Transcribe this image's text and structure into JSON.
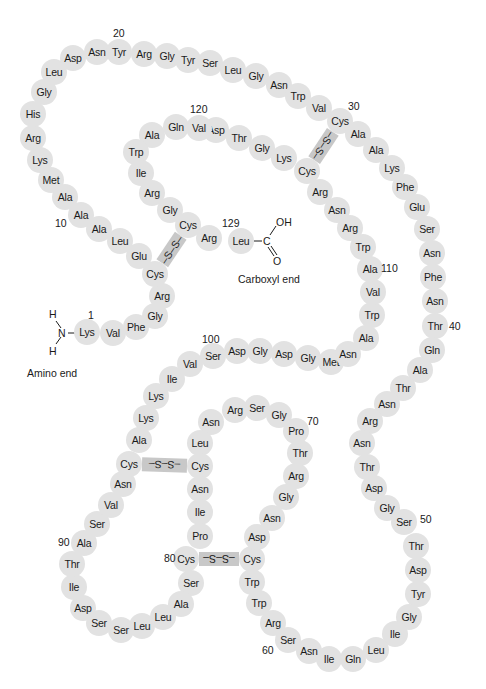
{
  "diagram": {
    "circle_color": "#e2e2e2",
    "bridge_color": "#c8c8c8",
    "residues": [
      {
        "n": 1,
        "aa": "Lys",
        "x": 87,
        "y": 332
      },
      {
        "n": 2,
        "aa": "Val",
        "x": 113,
        "y": 333
      },
      {
        "n": 3,
        "aa": "Phe",
        "x": 136,
        "y": 327
      },
      {
        "n": 4,
        "aa": "Gly",
        "x": 155,
        "y": 316
      },
      {
        "n": 5,
        "aa": "Arg",
        "x": 162,
        "y": 296
      },
      {
        "n": 6,
        "aa": "Cys",
        "x": 155,
        "y": 274
      },
      {
        "n": 7,
        "aa": "Glu",
        "x": 139,
        "y": 256
      },
      {
        "n": 8,
        "aa": "Leu",
        "x": 120,
        "y": 241
      },
      {
        "n": 9,
        "aa": "Ala",
        "x": 99,
        "y": 229
      },
      {
        "n": 10,
        "aa": "Ala",
        "x": 81,
        "y": 215
      },
      {
        "n": 11,
        "aa": "Ala",
        "x": 65,
        "y": 197
      },
      {
        "n": 12,
        "aa": "Met",
        "x": 51,
        "y": 180
      },
      {
        "n": 13,
        "aa": "Lys",
        "x": 40,
        "y": 160
      },
      {
        "n": 14,
        "aa": "Arg",
        "x": 33,
        "y": 138
      },
      {
        "n": 15,
        "aa": "His",
        "x": 33,
        "y": 114
      },
      {
        "n": 16,
        "aa": "Gly",
        "x": 44,
        "y": 92
      },
      {
        "n": 17,
        "aa": "Leu",
        "x": 54,
        "y": 72
      },
      {
        "n": 18,
        "aa": "Asp",
        "x": 73,
        "y": 58
      },
      {
        "n": 19,
        "aa": "Asn",
        "x": 97,
        "y": 52
      },
      {
        "n": 20,
        "aa": "Tyr",
        "x": 119,
        "y": 52
      },
      {
        "n": 21,
        "aa": "Arg",
        "x": 144,
        "y": 54
      },
      {
        "n": 22,
        "aa": "Gly",
        "x": 167,
        "y": 56
      },
      {
        "n": 23,
        "aa": "Tyr",
        "x": 188,
        "y": 60
      },
      {
        "n": 24,
        "aa": "Ser",
        "x": 210,
        "y": 63
      },
      {
        "n": 25,
        "aa": "Leu",
        "x": 233,
        "y": 70
      },
      {
        "n": 26,
        "aa": "Gly",
        "x": 256,
        "y": 76
      },
      {
        "n": 27,
        "aa": "Asn",
        "x": 279,
        "y": 85
      },
      {
        "n": 28,
        "aa": "Trp",
        "x": 298,
        "y": 96
      },
      {
        "n": 29,
        "aa": "Val",
        "x": 319,
        "y": 108
      },
      {
        "n": 30,
        "aa": "Cys",
        "x": 340,
        "y": 121
      },
      {
        "n": 31,
        "aa": "Ala",
        "x": 358,
        "y": 134
      },
      {
        "n": 32,
        "aa": "Ala",
        "x": 376,
        "y": 150
      },
      {
        "n": 33,
        "aa": "Lys",
        "x": 392,
        "y": 168
      },
      {
        "n": 34,
        "aa": "Phe",
        "x": 405,
        "y": 187
      },
      {
        "n": 35,
        "aa": "Glu",
        "x": 417,
        "y": 207
      },
      {
        "n": 36,
        "aa": "Ser",
        "x": 427,
        "y": 229
      },
      {
        "n": 37,
        "aa": "Asn",
        "x": 432,
        "y": 253
      },
      {
        "n": 38,
        "aa": "Phe",
        "x": 433,
        "y": 277
      },
      {
        "n": 39,
        "aa": "Asn",
        "x": 435,
        "y": 301
      },
      {
        "n": 40,
        "aa": "Thr",
        "x": 435,
        "y": 326
      },
      {
        "n": 41,
        "aa": "Gln",
        "x": 432,
        "y": 350
      },
      {
        "n": 42,
        "aa": "Ala",
        "x": 420,
        "y": 370
      },
      {
        "n": 43,
        "aa": "Thr",
        "x": 403,
        "y": 388
      },
      {
        "n": 44,
        "aa": "Asn",
        "x": 387,
        "y": 404
      },
      {
        "n": 45,
        "aa": "Arg",
        "x": 370,
        "y": 421
      },
      {
        "n": 46,
        "aa": "Asn",
        "x": 362,
        "y": 443
      },
      {
        "n": 47,
        "aa": "Thr",
        "x": 367,
        "y": 467
      },
      {
        "n": 48,
        "aa": "Asp",
        "x": 374,
        "y": 488
      },
      {
        "n": 49,
        "aa": "Gly",
        "x": 387,
        "y": 508
      },
      {
        "n": 50,
        "aa": "Ser",
        "x": 404,
        "y": 522
      },
      {
        "n": 51,
        "aa": "Thr",
        "x": 416,
        "y": 546
      },
      {
        "n": 52,
        "aa": "Asp",
        "x": 418,
        "y": 570
      },
      {
        "n": 53,
        "aa": "Tyr",
        "x": 418,
        "y": 594
      },
      {
        "n": 54,
        "aa": "Gly",
        "x": 409,
        "y": 617
      },
      {
        "n": 55,
        "aa": "Ile",
        "x": 395,
        "y": 634
      },
      {
        "n": 56,
        "aa": "Leu",
        "x": 376,
        "y": 650
      },
      {
        "n": 57,
        "aa": "Gln",
        "x": 353,
        "y": 659
      },
      {
        "n": 58,
        "aa": "Ile",
        "x": 329,
        "y": 659
      },
      {
        "n": 59,
        "aa": "Asn",
        "x": 309,
        "y": 651
      },
      {
        "n": 60,
        "aa": "Ser",
        "x": 288,
        "y": 640
      },
      {
        "n": 61,
        "aa": "Arg",
        "x": 273,
        "y": 623
      },
      {
        "n": 62,
        "aa": "Trp",
        "x": 259,
        "y": 603
      },
      {
        "n": 63,
        "aa": "Trp",
        "x": 252,
        "y": 582
      },
      {
        "n": 64,
        "aa": "Cys",
        "x": 252,
        "y": 559
      },
      {
        "n": 65,
        "aa": "Asp",
        "x": 257,
        "y": 537
      },
      {
        "n": 66,
        "aa": "Asn",
        "x": 272,
        "y": 518
      },
      {
        "n": 67,
        "aa": "Gly",
        "x": 286,
        "y": 497
      },
      {
        "n": 68,
        "aa": "Arg",
        "x": 296,
        "y": 476
      },
      {
        "n": 69,
        "aa": "Thr",
        "x": 300,
        "y": 453
      },
      {
        "n": 70,
        "aa": "Pro",
        "x": 296,
        "y": 431
      },
      {
        "n": 71,
        "aa": "Gly",
        "x": 279,
        "y": 415
      },
      {
        "n": 72,
        "aa": "Ser",
        "x": 257,
        "y": 408
      },
      {
        "n": 73,
        "aa": "Arg",
        "x": 235,
        "y": 410
      },
      {
        "n": 74,
        "aa": "Asn",
        "x": 211,
        "y": 422
      },
      {
        "n": 75,
        "aa": "Leu",
        "x": 200,
        "y": 443
      },
      {
        "n": 76,
        "aa": "Cys",
        "x": 200,
        "y": 466
      },
      {
        "n": 77,
        "aa": "Asn",
        "x": 200,
        "y": 489
      },
      {
        "n": 78,
        "aa": "Ile",
        "x": 200,
        "y": 512
      },
      {
        "n": 79,
        "aa": "Pro",
        "x": 200,
        "y": 536
      },
      {
        "n": 80,
        "aa": "Cys",
        "x": 186,
        "y": 559
      },
      {
        "n": 81,
        "aa": "Ser",
        "x": 191,
        "y": 583
      },
      {
        "n": 82,
        "aa": "Ala",
        "x": 181,
        "y": 604
      },
      {
        "n": 83,
        "aa": "Leu",
        "x": 163,
        "y": 617
      },
      {
        "n": 84,
        "aa": "Leu",
        "x": 142,
        "y": 626
      },
      {
        "n": 85,
        "aa": "Ser",
        "x": 121,
        "y": 630
      },
      {
        "n": 86,
        "aa": "Ser",
        "x": 99,
        "y": 623
      },
      {
        "n": 87,
        "aa": "Asp",
        "x": 83,
        "y": 608
      },
      {
        "n": 88,
        "aa": "Ile",
        "x": 74,
        "y": 587
      },
      {
        "n": 89,
        "aa": "Thr",
        "x": 72,
        "y": 564
      },
      {
        "n": 90,
        "aa": "Ala",
        "x": 84,
        "y": 543
      },
      {
        "n": 91,
        "aa": "Ser",
        "x": 97,
        "y": 524
      },
      {
        "n": 92,
        "aa": "Val",
        "x": 111,
        "y": 505
      },
      {
        "n": 93,
        "aa": "Asn",
        "x": 123,
        "y": 484
      },
      {
        "n": 94,
        "aa": "Cys",
        "x": 129,
        "y": 464
      },
      {
        "n": 95,
        "aa": "Ala",
        "x": 139,
        "y": 440
      },
      {
        "n": 96,
        "aa": "Lys",
        "x": 146,
        "y": 418
      },
      {
        "n": 97,
        "aa": "Lys",
        "x": 156,
        "y": 396
      },
      {
        "n": 98,
        "aa": "Ile",
        "x": 172,
        "y": 379
      },
      {
        "n": 99,
        "aa": "Val",
        "x": 190,
        "y": 364
      },
      {
        "n": 100,
        "aa": "Ser",
        "x": 213,
        "y": 356
      },
      {
        "n": 101,
        "aa": "Asp",
        "x": 237,
        "y": 351
      },
      {
        "n": 102,
        "aa": "Gly",
        "x": 260,
        "y": 351
      },
      {
        "n": 103,
        "aa": "Asp",
        "x": 284,
        "y": 354
      },
      {
        "n": 104,
        "aa": "Gly",
        "x": 308,
        "y": 358
      },
      {
        "n": 105,
        "aa": "Met",
        "x": 331,
        "y": 362
      },
      {
        "n": 106,
        "aa": "Asn",
        "x": 348,
        "y": 354
      },
      {
        "n": 107,
        "aa": "Ala",
        "x": 366,
        "y": 338
      },
      {
        "n": 108,
        "aa": "Trp",
        "x": 372,
        "y": 315
      },
      {
        "n": 109,
        "aa": "Val",
        "x": 373,
        "y": 292
      },
      {
        "n": 110,
        "aa": "Ala",
        "x": 370,
        "y": 269
      },
      {
        "n": 111,
        "aa": "Trp",
        "x": 363,
        "y": 247
      },
      {
        "n": 112,
        "aa": "Arg",
        "x": 350,
        "y": 228
      },
      {
        "n": 113,
        "aa": "Asn",
        "x": 337,
        "y": 210
      },
      {
        "n": 114,
        "aa": "Arg",
        "x": 320,
        "y": 192
      },
      {
        "n": 115,
        "aa": "Cys",
        "x": 307,
        "y": 171
      },
      {
        "n": 116,
        "aa": "Lys",
        "x": 284,
        "y": 158
      },
      {
        "n": 117,
        "aa": "Gly",
        "x": 262,
        "y": 148
      },
      {
        "n": 118,
        "aa": "Thr",
        "x": 239,
        "y": 138
      },
      {
        "n": 119,
        "aa": "Asp",
        "x": 216,
        "y": 130
      },
      {
        "n": 120,
        "aa": "Val",
        "x": 199,
        "y": 128
      },
      {
        "n": 121,
        "aa": "Gln",
        "x": 176,
        "y": 127
      },
      {
        "n": 122,
        "aa": "Ala",
        "x": 152,
        "y": 135
      },
      {
        "n": 123,
        "aa": "Trp",
        "x": 136,
        "y": 152
      },
      {
        "n": 124,
        "aa": "Ile",
        "x": 141,
        "y": 173
      },
      {
        "n": 125,
        "aa": "Arg",
        "x": 152,
        "y": 193
      },
      {
        "n": 126,
        "aa": "Gly",
        "x": 170,
        "y": 210
      },
      {
        "n": 127,
        "aa": "Cys",
        "x": 188,
        "y": 225
      },
      {
        "n": 128,
        "aa": "Arg",
        "x": 209,
        "y": 238
      },
      {
        "n": 129,
        "aa": "Leu",
        "x": 241,
        "y": 241
      }
    ],
    "number_labels": [
      {
        "text": "1",
        "x": 88,
        "y": 310
      },
      {
        "text": "10",
        "x": 55,
        "y": 218
      },
      {
        "text": "20",
        "x": 113,
        "y": 28
      },
      {
        "text": "30",
        "x": 348,
        "y": 101
      },
      {
        "text": "40",
        "x": 449,
        "y": 321
      },
      {
        "text": "50",
        "x": 420,
        "y": 514
      },
      {
        "text": "60",
        "x": 262,
        "y": 645
      },
      {
        "text": "70",
        "x": 307,
        "y": 416
      },
      {
        "text": "80",
        "x": 164,
        "y": 553
      },
      {
        "text": "90",
        "x": 58,
        "y": 537
      },
      {
        "text": "100",
        "x": 202,
        "y": 334
      },
      {
        "text": "110",
        "x": 381,
        "y": 263
      },
      {
        "text": "120",
        "x": 190,
        "y": 104
      },
      {
        "text": "129",
        "x": 222,
        "y": 218
      }
    ],
    "disulfide_bridges": [
      {
        "from": 6,
        "to": 127,
        "label": "–S–S–"
      },
      {
        "from": 30,
        "to": 115,
        "label": "–S–S–"
      },
      {
        "from": 64,
        "to": 80,
        "label": "–S–S–"
      },
      {
        "from": 76,
        "to": 94,
        "label": "–S–S–"
      }
    ],
    "amino_end": {
      "label": "Amino end",
      "atom_N": "N",
      "atom_H_top": "H",
      "atom_H_bottom": "H"
    },
    "carboxyl_end": {
      "label": "Carboxyl end",
      "atom_C": "C",
      "atom_OH": "OH",
      "atom_O": "O"
    }
  }
}
